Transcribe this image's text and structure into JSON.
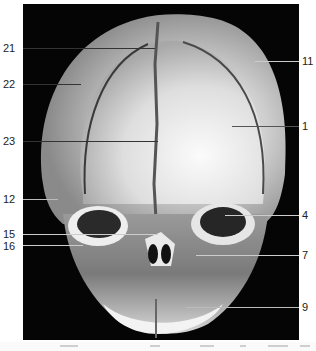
{
  "figure": {
    "background_color": "#050505",
    "labels_left": [
      {
        "id": "21",
        "text": "21",
        "y": 48
      },
      {
        "id": "22",
        "text": "22",
        "y": 84
      },
      {
        "id": "23",
        "text": "23",
        "y": 141
      },
      {
        "id": "12",
        "text": "12",
        "y": 199
      },
      {
        "id": "15",
        "text": "15",
        "y": 235
      },
      {
        "id": "16",
        "text": "16",
        "y": 246
      }
    ],
    "labels_right": [
      {
        "id": "11",
        "text": "11",
        "y": 61
      },
      {
        "id": "1",
        "text": "1",
        "y": 126
      },
      {
        "id": "4",
        "text": "4",
        "y": 215
      },
      {
        "id": "7",
        "text": "7",
        "y": 255
      },
      {
        "id": "9",
        "text": "9",
        "y": 307
      }
    ]
  }
}
